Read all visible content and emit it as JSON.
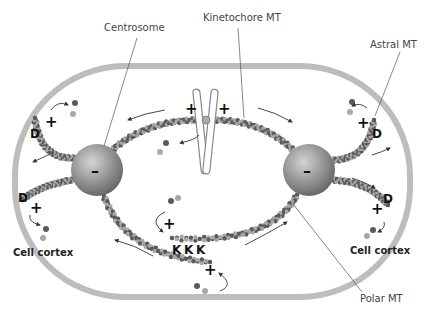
{
  "labels": {
    "centrosome": "Centrosome",
    "kinetochore_mt": "Kinetochore MT",
    "astral_mt": "Astral MT",
    "polar_mt": "Polar MT",
    "cell_cortex_left": "Cell cortex",
    "cell_cortex_right": "Cell cortex"
  },
  "symbols": {
    "plus": "+",
    "minus": "–",
    "dynein": "D",
    "kinesin": "K"
  },
  "colors": {
    "cell_membrane": "#b8b8b8",
    "centrosome_light": "#d0d0d0",
    "centrosome_dark": "#6e6e6e",
    "tubulin_dark": "#5a5a5a",
    "tubulin_light": "#a8a8a8",
    "leader_line": "#555555",
    "arrow": "#333333"
  }
}
